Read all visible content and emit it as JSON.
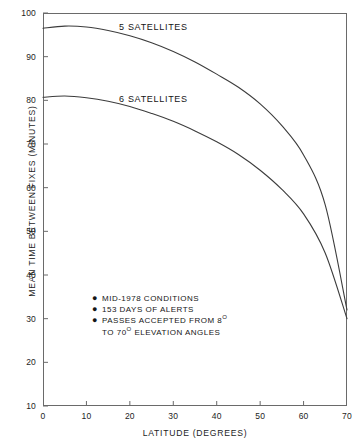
{
  "chart_data": {
    "type": "line",
    "title": "",
    "xlabel": "LATITUDE (DEGREES)",
    "ylabel": "MEAN TIME BETWEEN FIXES (MINUTES)",
    "xlim": [
      0,
      70
    ],
    "ylim": [
      10,
      100
    ],
    "xticks": [
      0,
      10,
      20,
      30,
      40,
      50,
      60,
      70
    ],
    "yticks": [
      10,
      20,
      30,
      40,
      50,
      60,
      70,
      80,
      90,
      100
    ],
    "xtick_labels": [
      "0",
      "10",
      "20",
      "30",
      "40",
      "50",
      "60",
      "70"
    ],
    "ytick_labels": [
      "10",
      "20",
      "30",
      "40",
      "50",
      "60",
      "70",
      "80",
      "90",
      "100"
    ],
    "grid": false,
    "legend_position": "inline-labels",
    "line_color": "#3c3c3c",
    "axis_color": "#6a6a6a",
    "background": "#ffffff",
    "x": [
      0,
      5,
      10,
      15,
      20,
      25,
      30,
      35,
      40,
      45,
      50,
      55,
      60,
      65,
      70
    ],
    "series": [
      {
        "name": "5 SATELLITES",
        "label": "5 SATELLITES",
        "values": [
          96.5,
          97.0,
          96.8,
          96.0,
          94.8,
          93.2,
          91.2,
          88.8,
          86.0,
          83.0,
          79.2,
          74.2,
          67.5,
          56.0,
          32.0
        ]
      },
      {
        "name": "6 SATELLITES",
        "label": "6 SATELLITES",
        "values": [
          80.7,
          81.0,
          80.6,
          79.8,
          78.6,
          77.0,
          75.2,
          73.0,
          70.5,
          67.6,
          64.0,
          59.6,
          54.0,
          45.0,
          30.0
        ]
      }
    ],
    "annotations": [
      {
        "bullet": "●",
        "text": "MID-1978 CONDITIONS"
      },
      {
        "bullet": "●",
        "text": "153 DAYS OF ALERTS"
      },
      {
        "bullet": "●",
        "text_before": "PASSES ACCEPTED FROM 8",
        "degree": "O",
        "text_after": "",
        "continuation_before": "TO 70",
        "continuation_degree": "O",
        "continuation_after": " ELEVATION ANGLES"
      }
    ]
  }
}
